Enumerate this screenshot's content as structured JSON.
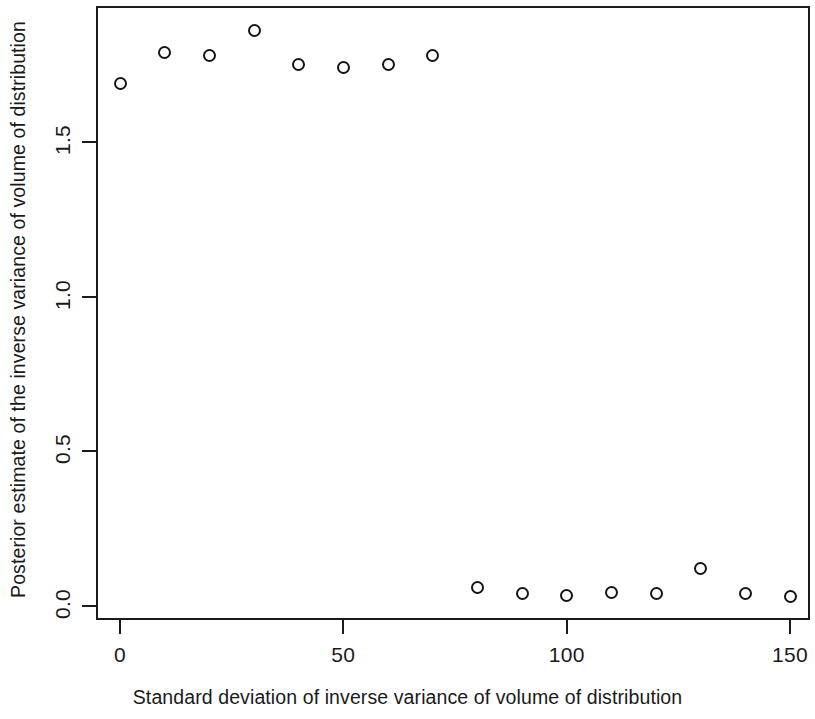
{
  "chart_data": {
    "type": "scatter",
    "title": "",
    "xlabel": "Standard deviation of inverse variance of volume of distribution",
    "ylabel": "Posterior estimate of the inverse variance of volume of distribution",
    "xlim": [
      -5,
      155
    ],
    "ylim": [
      -0.03,
      1.95
    ],
    "grid": false,
    "legend": null,
    "marker": "open-circle",
    "marker_color": "#151515",
    "x": [
      0,
      10,
      20,
      30,
      40,
      50,
      60,
      70,
      80,
      90,
      100,
      110,
      120,
      130,
      140,
      150
    ],
    "y": [
      1.69,
      1.79,
      1.78,
      1.86,
      1.75,
      1.74,
      1.75,
      1.78,
      0.06,
      0.04,
      0.035,
      0.045,
      0.04,
      0.12,
      0.04,
      0.03
    ],
    "series": [
      {
        "name": "Posterior estimate",
        "points": [
          {
            "x": 0,
            "y": 1.69
          },
          {
            "x": 10,
            "y": 1.79
          },
          {
            "x": 20,
            "y": 1.78
          },
          {
            "x": 30,
            "y": 1.86
          },
          {
            "x": 40,
            "y": 1.75
          },
          {
            "x": 50,
            "y": 1.74
          },
          {
            "x": 60,
            "y": 1.75
          },
          {
            "x": 70,
            "y": 1.78
          },
          {
            "x": 80,
            "y": 0.06
          },
          {
            "x": 90,
            "y": 0.04
          },
          {
            "x": 100,
            "y": 0.035
          },
          {
            "x": 110,
            "y": 0.045
          },
          {
            "x": 120,
            "y": 0.04
          },
          {
            "x": 130,
            "y": 0.12
          },
          {
            "x": 140,
            "y": 0.04
          },
          {
            "x": 150,
            "y": 0.03
          }
        ]
      }
    ],
    "x_ticks": [
      {
        "value": 0,
        "label": "0"
      },
      {
        "value": 50,
        "label": "50"
      },
      {
        "value": 100,
        "label": "100"
      },
      {
        "value": 150,
        "label": "150"
      }
    ],
    "y_ticks": [
      {
        "value": 0.0,
        "label": "0.0"
      },
      {
        "value": 0.5,
        "label": "0.5"
      },
      {
        "value": 1.0,
        "label": "1.0"
      },
      {
        "value": 1.5,
        "label": "1.5"
      }
    ]
  },
  "axes": {
    "x_title": "Standard deviation of inverse variance of volume of distribution",
    "y_title": "Posterior estimate of the inverse variance of volume of distribution"
  }
}
